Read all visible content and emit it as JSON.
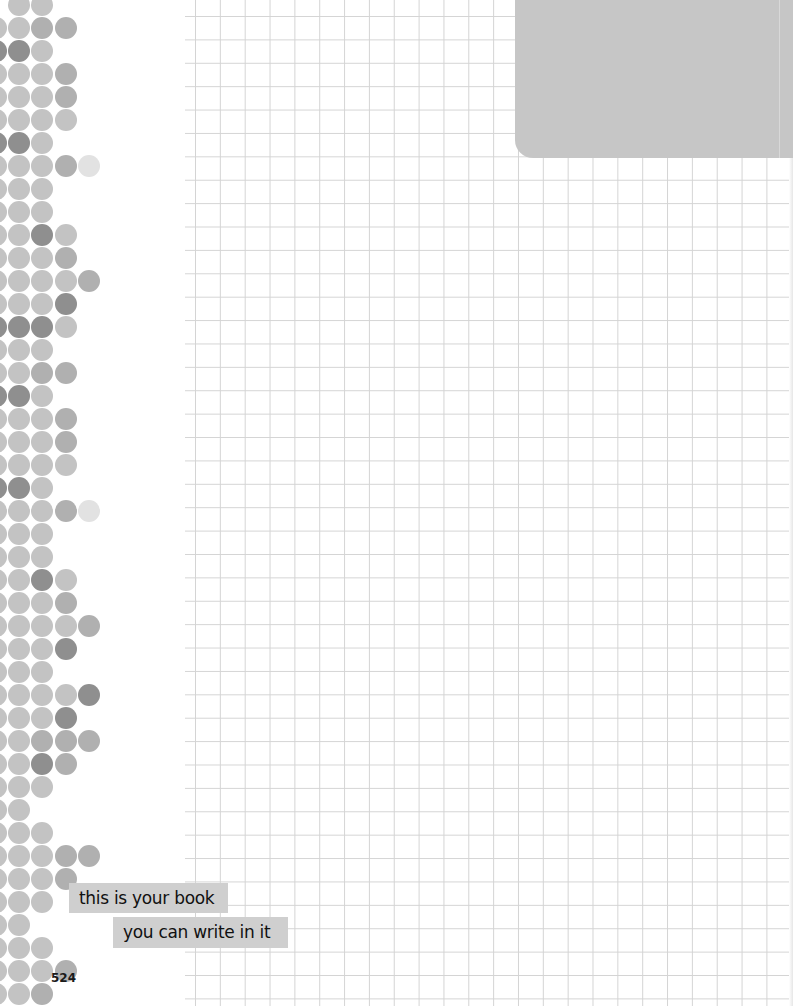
{
  "page": {
    "type": "notebook-grid-page",
    "page_number": "524",
    "labels": [
      "this is your book",
      "you can write in it"
    ]
  },
  "colors": {
    "grid_line": "#d4d4d4",
    "corner_tab": "#c6c6c6",
    "label_bg": "#cfcfcf",
    "dot_light": "#c3c3c3",
    "dot_mid": "#b0b0b0",
    "dot_dark": "#8f8f8f",
    "dot_pale": "#e2e2e2"
  },
  "dot_pattern": {
    "column_x": [
      -15,
      8,
      31,
      55,
      78
    ],
    "row_start_y": -6,
    "row_pitch": 23,
    "rows": [
      [
        "",
        "l",
        "l",
        "",
        ""
      ],
      [
        "l",
        "l",
        "m",
        "m",
        ""
      ],
      [
        "d",
        "d",
        "l",
        "",
        ""
      ],
      [
        "l",
        "l",
        "l",
        "m",
        ""
      ],
      [
        "l",
        "l",
        "l",
        "m",
        ""
      ],
      [
        "l",
        "l",
        "l",
        "l",
        ""
      ],
      [
        "d",
        "d",
        "l",
        "",
        ""
      ],
      [
        "l",
        "l",
        "l",
        "m",
        "p"
      ],
      [
        "l",
        "l",
        "l",
        "",
        ""
      ],
      [
        "l",
        "l",
        "l",
        "",
        ""
      ],
      [
        "l",
        "l",
        "d",
        "l",
        ""
      ],
      [
        "l",
        "l",
        "l",
        "m",
        ""
      ],
      [
        "l",
        "l",
        "l",
        "l",
        "m"
      ],
      [
        "l",
        "l",
        "l",
        "d",
        ""
      ],
      [
        "d",
        "d",
        "d",
        "l",
        ""
      ],
      [
        "l",
        "l",
        "l",
        "",
        ""
      ],
      [
        "l",
        "l",
        "m",
        "m",
        ""
      ],
      [
        "d",
        "d",
        "l",
        "",
        ""
      ],
      [
        "l",
        "l",
        "l",
        "m",
        ""
      ],
      [
        "l",
        "l",
        "l",
        "m",
        ""
      ],
      [
        "l",
        "l",
        "l",
        "l",
        ""
      ],
      [
        "d",
        "d",
        "l",
        "",
        ""
      ],
      [
        "l",
        "l",
        "l",
        "m",
        "p"
      ],
      [
        "l",
        "l",
        "l",
        "",
        ""
      ],
      [
        "l",
        "l",
        "l",
        "",
        ""
      ],
      [
        "l",
        "l",
        "d",
        "l",
        ""
      ],
      [
        "l",
        "l",
        "l",
        "m",
        ""
      ],
      [
        "l",
        "l",
        "l",
        "l",
        "m"
      ],
      [
        "l",
        "l",
        "l",
        "d",
        ""
      ],
      [
        "l",
        "l",
        "l",
        "",
        ""
      ],
      [
        "l",
        "l",
        "l",
        "l",
        "d"
      ],
      [
        "l",
        "l",
        "l",
        "d",
        ""
      ],
      [
        "l",
        "l",
        "m",
        "m",
        "m"
      ],
      [
        "l",
        "l",
        "d",
        "m",
        ""
      ],
      [
        "l",
        "l",
        "l",
        "",
        ""
      ],
      [
        "l",
        "l",
        "",
        "",
        ""
      ],
      [
        "l",
        "l",
        "l",
        "",
        ""
      ],
      [
        "l",
        "l",
        "l",
        "m",
        "m"
      ],
      [
        "l",
        "l",
        "l",
        "m",
        ""
      ],
      [
        "l",
        "l",
        "l",
        "",
        ""
      ],
      [
        "l",
        "l",
        "",
        "",
        ""
      ],
      [
        "l",
        "l",
        "l",
        "",
        ""
      ],
      [
        "l",
        "l",
        "l",
        "m",
        ""
      ],
      [
        "l",
        "l",
        "m",
        "",
        ""
      ]
    ]
  }
}
